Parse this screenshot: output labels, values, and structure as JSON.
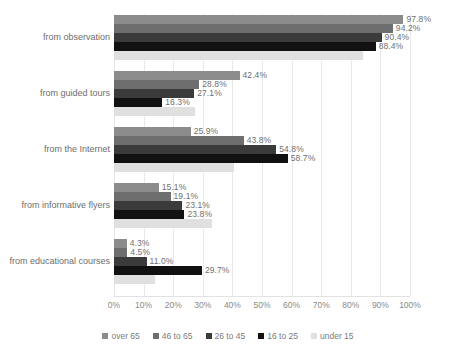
{
  "chart_data": {
    "type": "bar",
    "orientation": "horizontal",
    "title": "",
    "xlabel": "",
    "ylabel": "",
    "xlim": [
      0,
      100
    ],
    "xticks": [
      "0%",
      "10%",
      "20%",
      "30%",
      "40%",
      "50%",
      "60%",
      "70%",
      "80%",
      "90%",
      "100%"
    ],
    "grid": true,
    "legend_position": "bottom",
    "categories": [
      "from observation",
      "from guided tours",
      "from the Internet",
      "from informative flyers",
      "from educational courses"
    ],
    "series": [
      {
        "name": "over 65",
        "color": "#8c8c8c",
        "values": [
          97.8,
          42.4,
          25.9,
          15.1,
          4.3
        ],
        "labels": [
          "97.8%",
          "42.4%",
          "25.9%",
          "15.1%",
          "4.3%"
        ]
      },
      {
        "name": "46 to 65",
        "color": "#6e6e6e",
        "values": [
          94.2,
          28.8,
          43.8,
          19.1,
          4.5
        ],
        "labels": [
          "94.2%",
          "28.8%",
          "43.8%",
          "19.1%",
          "4.5%"
        ]
      },
      {
        "name": "26 to 45",
        "color": "#3b3b3b",
        "values": [
          90.4,
          27.1,
          54.8,
          23.1,
          11.0
        ],
        "labels": [
          "90.4%",
          "27.1%",
          "54.8%",
          "23.1%",
          "11.0%"
        ]
      },
      {
        "name": "16 to 25",
        "color": "#111111",
        "values": [
          88.4,
          16.3,
          58.7,
          23.8,
          29.7
        ],
        "labels": [
          "88.4%",
          "16.3%",
          "58.7%",
          "23.8%",
          "29.7%"
        ]
      },
      {
        "name": "under 15",
        "color": "#e0e0e0",
        "values": [
          84.0,
          27.5,
          40.5,
          33.0,
          14.0
        ],
        "labels": [
          "",
          "",
          "",
          "",
          ""
        ]
      }
    ]
  }
}
